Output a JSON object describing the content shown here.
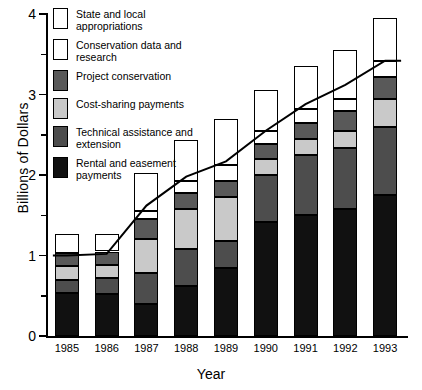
{
  "chart_data": {
    "type": "bar",
    "subtype": "stacked-bar-with-line-overlay",
    "title": "",
    "xlabel": "Year",
    "ylabel": "Billions of Dollars",
    "categories": [
      "1985",
      "1986",
      "1987",
      "1988",
      "1989",
      "1990",
      "1991",
      "1992",
      "1993"
    ],
    "ylim": [
      0,
      4
    ],
    "yticks": [
      0,
      1,
      2,
      3,
      4
    ],
    "ytick_labels": [
      "0",
      "1",
      "2",
      "3",
      "4"
    ],
    "yminor_ticks": [
      0.5,
      1.5,
      2.5,
      3.5
    ],
    "grid": false,
    "legend_position": "upper-left-inside",
    "series": [
      {
        "name": "Rental and easement payments",
        "color": "#111111",
        "values": [
          0.53,
          0.52,
          0.4,
          0.62,
          0.85,
          1.42,
          1.5,
          1.58,
          1.75
        ]
      },
      {
        "name": "Technical assistance and extension",
        "color": "#4d4d4d",
        "values": [
          0.17,
          0.2,
          0.38,
          0.46,
          0.33,
          0.58,
          0.75,
          0.75,
          0.85
        ]
      },
      {
        "name": "Cost-sharing payments",
        "color": "#c9c9c9",
        "values": [
          0.17,
          0.16,
          0.42,
          0.5,
          0.55,
          0.2,
          0.2,
          0.22,
          0.35
        ]
      },
      {
        "name": "Project conservation",
        "color": "#595959",
        "values": [
          0.16,
          0.17,
          0.25,
          0.2,
          0.2,
          0.18,
          0.2,
          0.25,
          0.27
        ]
      },
      {
        "name": "Conservation data and research",
        "color": "#ffffff",
        "values": [
          0.24,
          0.22,
          0.1,
          0.15,
          0.19,
          0.17,
          0.17,
          0.15,
          0.2
        ]
      },
      {
        "name": "State and local appropriations",
        "color": "#ffffff",
        "values": [
          0.0,
          0.0,
          0.47,
          0.5,
          0.58,
          0.5,
          0.53,
          0.6,
          0.53
        ]
      }
    ],
    "totals": [
      1.27,
      1.27,
      2.02,
      2.43,
      2.7,
      3.05,
      3.35,
      3.55,
      3.95
    ],
    "overlay_line": {
      "name": "Constant-dollar trend",
      "color": "#000000",
      "values": [
        1.0,
        1.02,
        1.62,
        1.98,
        2.17,
        2.55,
        2.88,
        3.12,
        3.42
      ]
    }
  },
  "legend": {
    "items": [
      {
        "label": "State and local appropriations",
        "swatch": "#ffffff"
      },
      {
        "label": "Conservation data and research",
        "swatch": "#ffffff"
      },
      {
        "label": "Project conservation",
        "swatch": "#595959"
      },
      {
        "label": "Cost-sharing payments",
        "swatch": "#c9c9c9"
      },
      {
        "label": "Technical assistance and extension",
        "swatch": "#4d4d4d"
      },
      {
        "label": "Rental and easement payments",
        "swatch": "#111111"
      }
    ]
  }
}
